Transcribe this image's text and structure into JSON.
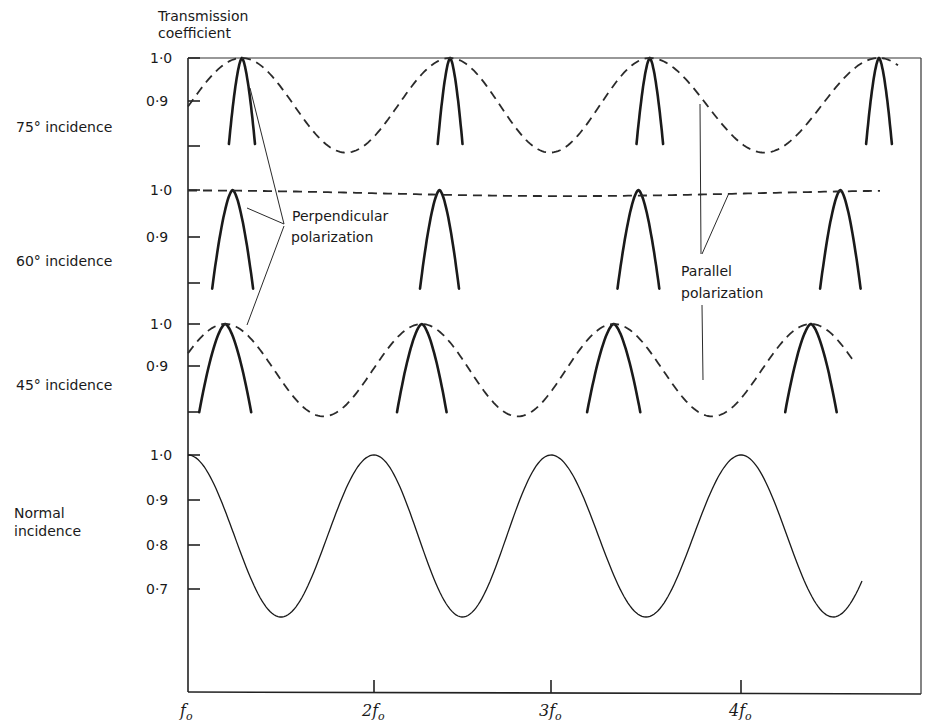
{
  "chart_data": {
    "type": "line",
    "ylabel": "Transmission coefficient",
    "xlabel": "",
    "x_ticks": [
      "f0",
      "2f0",
      "3f0",
      "4f0"
    ],
    "x_tick_labels": [
      {
        "main": "f",
        "sub": "o"
      },
      {
        "main": "2f",
        "sub": "o"
      },
      {
        "main": "3f",
        "sub": "o"
      },
      {
        "main": "4f",
        "sub": "o"
      }
    ],
    "x_range": [
      1.0,
      4.9
    ],
    "legend": [
      {
        "name": "Perpendicular polarization",
        "style": "solid-thick"
      },
      {
        "name": "Parallel polarization",
        "style": "dashed"
      }
    ],
    "annotations": [
      "Perpendicular polarization",
      "Parallel polarization"
    ],
    "panels": [
      {
        "label": "75° incidence",
        "y_ticks": [
          "1·0",
          "0·9"
        ],
        "y_range": [
          0.78,
          1.0
        ],
        "series": [
          {
            "name": "Perpendicular polarization",
            "style": "solid",
            "peaks_x": [
              1.29,
              2.43,
              3.52,
              4.75
            ],
            "peak_value": 1.0,
            "halfwidth": 0.07,
            "floor": 0.8
          },
          {
            "name": "Parallel polarization",
            "style": "dashed",
            "peaks_x": [
              1.29,
              2.43,
              3.52,
              4.75
            ],
            "max": 1.0,
            "min": 0.78,
            "start_value": 0.9
          }
        ]
      },
      {
        "label": "60° incidence",
        "y_ticks": [
          "1·0",
          "0·9"
        ],
        "y_range": [
          0.8,
          1.0
        ],
        "series": [
          {
            "name": "Perpendicular polarization",
            "style": "solid",
            "peaks_x": [
              1.24,
              2.37,
              3.46,
              4.54
            ],
            "peak_value": 1.0,
            "halfwidth": 0.11,
            "floor": 0.8
          },
          {
            "name": "Parallel polarization",
            "style": "dashed",
            "approx_value": 0.995,
            "max": 1.0,
            "min": 0.99
          }
        ]
      },
      {
        "label": "45° incidence",
        "y_ticks": [
          "1·0",
          "0·9"
        ],
        "y_range": [
          0.78,
          1.0
        ],
        "series": [
          {
            "name": "Perpendicular polarization",
            "style": "solid",
            "peaks_x": [
              1.2,
              2.27,
              3.33,
              4.38
            ],
            "peak_value": 1.0,
            "halfwidth": 0.14,
            "floor": 0.8
          },
          {
            "name": "Parallel polarization",
            "style": "dashed",
            "peaks_x": [
              1.2,
              2.27,
              3.33,
              4.38
            ],
            "max": 1.0,
            "min": 0.78,
            "start_value": 0.94
          }
        ]
      },
      {
        "label": "Normal incidence",
        "y_ticks": [
          "1·0",
          "0·9",
          "0·8",
          "0·7"
        ],
        "y_range": [
          0.64,
          1.0
        ],
        "series": [
          {
            "name": "Transmission",
            "style": "solid-thin",
            "peaks_x": [
              1.0,
              2.0,
              3.0,
              4.0
            ],
            "max": 1.0,
            "min": 0.64
          }
        ]
      }
    ]
  },
  "labels": {
    "ytitle_line1": "Transmission",
    "ytitle_line2": "coefficient",
    "panel_75": "75° incidence",
    "panel_60": "60° incidence",
    "panel_45": "45° incidence",
    "panel_normal_line1": "Normal",
    "panel_normal_line2": "incidence",
    "perp_line1": "Perpendicular",
    "perp_line2": "polarization",
    "par_line1": "Parallel",
    "par_line2": "polarization",
    "tick_10": "1·0",
    "tick_09": "0·9",
    "tick_08": "0·8",
    "tick_07": "0·7",
    "x_f": "f",
    "x_2f": "2f",
    "x_3f": "3f",
    "x_4f": "4f",
    "x_sub": "o"
  }
}
